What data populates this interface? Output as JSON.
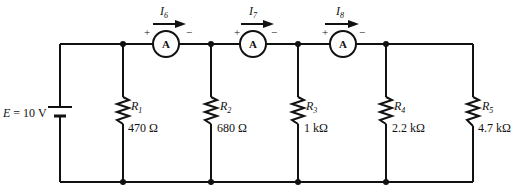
{
  "diagram": {
    "type": "parallel resistor circuit with ammeters",
    "source": {
      "label": "E = 10 V",
      "name": "E",
      "value": "10 V"
    },
    "ammeters": [
      {
        "symbol": "A",
        "current": "I",
        "current_sub": "6",
        "plus": "+",
        "minus": "−"
      },
      {
        "symbol": "A",
        "current": "I",
        "current_sub": "7",
        "plus": "+",
        "minus": "−"
      },
      {
        "symbol": "A",
        "current": "I",
        "current_sub": "8",
        "plus": "+",
        "minus": "−"
      }
    ],
    "resistors": [
      {
        "name": "R",
        "sub": "1",
        "value": "470 Ω"
      },
      {
        "name": "R",
        "sub": "2",
        "value": "680 Ω"
      },
      {
        "name": "R",
        "sub": "3",
        "value": "1 kΩ"
      },
      {
        "name": "R",
        "sub": "4",
        "value": "2.2 kΩ"
      },
      {
        "name": "R",
        "sub": "5",
        "value": "4.7 kΩ"
      }
    ]
  }
}
